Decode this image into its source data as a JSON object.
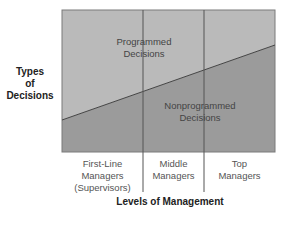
{
  "diagram": {
    "y_axis_label": [
      "Types",
      "of",
      "Decisions"
    ],
    "x_axis_label": "Levels of Management",
    "regions": {
      "upper": [
        "Programmed",
        "Decisions"
      ],
      "lower": [
        "Nonprogrammed",
        "Decisions"
      ]
    },
    "categories": [
      [
        "First-Line",
        "Managers",
        "(Supervisors)"
      ],
      [
        "Middle",
        "Managers"
      ],
      [
        "Top",
        "Managers"
      ]
    ],
    "colors": {
      "upper_fill": "#b9b9b9",
      "lower_fill": "#9a9a9a",
      "line": "#555555",
      "border": "#777777"
    }
  }
}
